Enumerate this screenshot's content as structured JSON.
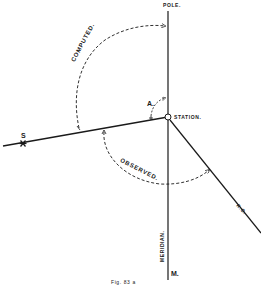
{
  "figure": {
    "caption": "Fig. 83 a",
    "labels": {
      "pole": "POLE.",
      "station": "STATION.",
      "star": "S",
      "angle": "A.",
      "computed": "COMPUTED.",
      "observed": "OBSERVED.",
      "reference_object": "R.O.",
      "meridian": "MERIDIAN.",
      "meridian_end": "M."
    },
    "colors": {
      "ink": "#1a1a1a",
      "background": "#ffffff"
    }
  }
}
